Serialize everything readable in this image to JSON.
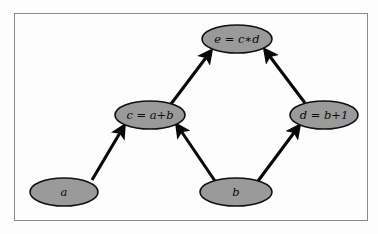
{
  "figure": {
    "background_color": "#fdfdfd",
    "frame": {
      "border_color": "#8a8a8e",
      "fill_color": "#fdfdfd"
    },
    "node_style": {
      "fill_color": "#9a9a9a",
      "stroke_color": "#111111",
      "text_color": "#0a0a0a"
    },
    "edge_style": {
      "color": "#090909",
      "arrowhead": "filled-triangle"
    }
  },
  "graph": {
    "nodes": [
      {
        "id": "a",
        "label": "a",
        "cx": 64,
        "cy": 192,
        "rx": 34,
        "ry": 14
      },
      {
        "id": "b",
        "label": "b",
        "cx": 236,
        "cy": 192,
        "rx": 36,
        "ry": 14
      },
      {
        "id": "c",
        "label": "c = a+b",
        "cx": 150,
        "cy": 115,
        "rx": 35,
        "ry": 14
      },
      {
        "id": "d",
        "label": "d = b+1",
        "cx": 324,
        "cy": 115,
        "rx": 34,
        "ry": 14
      },
      {
        "id": "e",
        "label": "e = c∗d",
        "cx": 237,
        "cy": 39,
        "rx": 35,
        "ry": 14
      }
    ],
    "edges": [
      {
        "from": "a",
        "to": "c",
        "label": ""
      },
      {
        "from": "b",
        "to": "c",
        "label": ""
      },
      {
        "from": "b",
        "to": "d",
        "label": ""
      },
      {
        "from": "c",
        "to": "e",
        "label": ""
      },
      {
        "from": "d",
        "to": "e",
        "label": ""
      }
    ]
  }
}
